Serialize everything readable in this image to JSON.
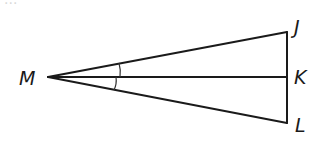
{
  "figure": {
    "top_fragment": "...",
    "stroke_color": "#1a1a1a",
    "points": {
      "M": {
        "x": 48,
        "y": 77,
        "label": "M"
      },
      "J": {
        "x": 287,
        "y": 32,
        "label": "J"
      },
      "K": {
        "x": 287,
        "y": 77,
        "label": "K"
      },
      "L": {
        "x": 287,
        "y": 123,
        "label": "L"
      }
    },
    "segments": [
      "MJ",
      "MK",
      "ML",
      "JL"
    ],
    "angle_marks": [
      {
        "between": [
          "MJ",
          "MK"
        ],
        "ticks": 1
      },
      {
        "between": [
          "MK",
          "ML"
        ],
        "ticks": 1
      }
    ]
  }
}
